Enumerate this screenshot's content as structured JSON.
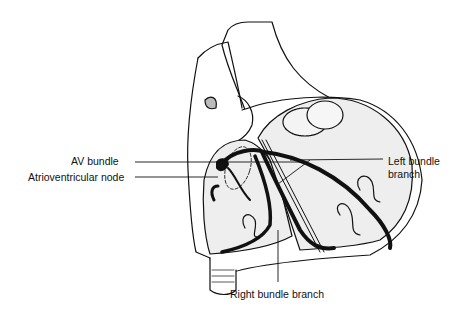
{
  "diagram": {
    "labels": {
      "av_bundle": "AV bundle",
      "av_node": "Atrioventricular node",
      "left_bundle_line1": "Left bundle",
      "left_bundle_line2": "branch",
      "right_bundle": "Right bundle branch"
    },
    "colors": {
      "ink": "#111111",
      "chamber_fill": "#eeeeee",
      "background": "#ffffff"
    }
  }
}
